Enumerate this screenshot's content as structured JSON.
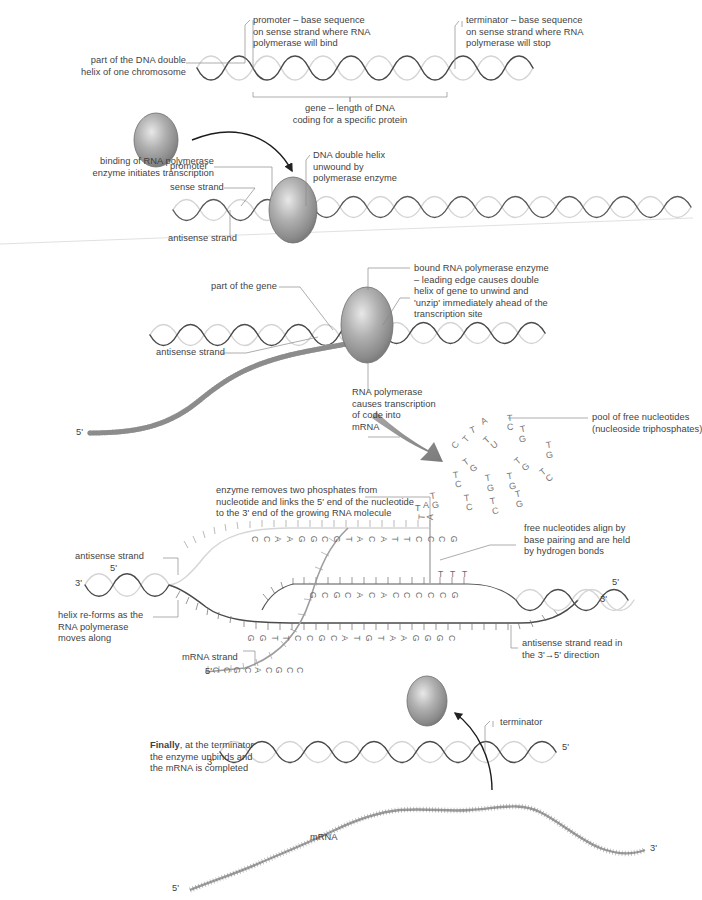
{
  "diagram": {
    "colors": {
      "sense_strand": "#555555",
      "antisense_strand": "#cccccc",
      "leader_line": "#8a8a8a",
      "text": "#3f3f3f",
      "enzyme_fill": "#8e8e8e",
      "enzyme_edge": "#5f5f5f",
      "mrna": "#9a9a9a",
      "separator": "#d8d8d8"
    }
  },
  "stage1": {
    "label_chromosome": "part of the DNA double\nhelix of one chromosome",
    "label_promoter": "promoter – base sequence\non sense strand where RNA\npolymerase will bind",
    "label_terminator": "terminator – base sequence\non sense strand where RNA\npolymerase will stop",
    "label_gene": "gene – length of DNA\ncoding for a specific protein"
  },
  "stage2": {
    "label_binding": "binding of RNA polymerase\nenzyme initiates transcription",
    "label_promoter": "promoter",
    "label_sense": "sense strand",
    "label_antisense": "antisense strand",
    "label_unwound": "DNA double helix\nunwound by\npolymerase enzyme"
  },
  "stage3": {
    "label_part_of_gene": "part of the gene",
    "label_antisense": "antisense strand",
    "label_bound_enzyme": "bound RNA polymerase enzyme\n– leading edge causes double\nhelix of gene to unwind and\n'unzip' immediately ahead of the\ntranscription site",
    "label_transcription": "RNA polymerase\ncauses transcription\nof code into\nmRNA",
    "label_pool": "pool of free nucleotides\n(nucleoside triphosphates)",
    "prime_5": "5'",
    "nucleotide_pool": [
      {
        "base": "T",
        "x": 470,
        "y": 425,
        "rot": -22
      },
      {
        "base": "A",
        "x": 481,
        "y": 416,
        "rot": -28
      },
      {
        "base": "C",
        "x": 452,
        "y": 440,
        "rot": -58
      },
      {
        "base": "T",
        "x": 463,
        "y": 434,
        "rot": -48
      },
      {
        "base": "U",
        "x": 491,
        "y": 440,
        "rot": -38
      },
      {
        "base": "T",
        "x": 484,
        "y": 435,
        "rot": -44
      },
      {
        "base": "C",
        "x": 507,
        "y": 422,
        "rot": -6
      },
      {
        "base": "T",
        "x": 507,
        "y": 413,
        "rot": -4
      },
      {
        "base": "G",
        "x": 519,
        "y": 434,
        "rot": -14
      },
      {
        "base": "T",
        "x": 520,
        "y": 424,
        "rot": -12
      },
      {
        "base": "G",
        "x": 546,
        "y": 450,
        "rot": -10
      },
      {
        "base": "T",
        "x": 546,
        "y": 440,
        "rot": -8
      },
      {
        "base": "G",
        "x": 470,
        "y": 463,
        "rot": -34
      },
      {
        "base": "T",
        "x": 463,
        "y": 457,
        "rot": -34
      },
      {
        "base": "G",
        "x": 522,
        "y": 462,
        "rot": -40
      },
      {
        "base": "T",
        "x": 515,
        "y": 456,
        "rot": -40
      },
      {
        "base": "C",
        "x": 455,
        "y": 479,
        "rot": -8
      },
      {
        "base": "T",
        "x": 453,
        "y": 470,
        "rot": -6
      },
      {
        "base": "G",
        "x": 487,
        "y": 483,
        "rot": -10
      },
      {
        "base": "T",
        "x": 485,
        "y": 473,
        "rot": -8
      },
      {
        "base": "G",
        "x": 509,
        "y": 481,
        "rot": -12
      },
      {
        "base": "T",
        "x": 507,
        "y": 471,
        "rot": -10
      },
      {
        "base": "C",
        "x": 546,
        "y": 473,
        "rot": -38
      },
      {
        "base": "T",
        "x": 540,
        "y": 467,
        "rot": -38
      },
      {
        "base": "G",
        "x": 432,
        "y": 500,
        "rot": -10
      },
      {
        "base": "T",
        "x": 430,
        "y": 491,
        "rot": -8
      },
      {
        "base": "C",
        "x": 466,
        "y": 502,
        "rot": -8
      },
      {
        "base": "T",
        "x": 464,
        "y": 493,
        "rot": -6
      },
      {
        "base": "C",
        "x": 492,
        "y": 506,
        "rot": -12
      },
      {
        "base": "T",
        "x": 490,
        "y": 496,
        "rot": -10
      },
      {
        "base": "G",
        "x": 516,
        "y": 499,
        "rot": -14
      },
      {
        "base": "T",
        "x": 515,
        "y": 489,
        "rot": -12
      },
      {
        "base": "A",
        "x": 427,
        "y": 512,
        "rot": -86
      },
      {
        "base": "T",
        "x": 419,
        "y": 512,
        "rot": -86
      }
    ]
  },
  "stage4": {
    "label_enzyme_removes": "enzyme removes two phosphates from\nnucleotide and links the 5' end of the nucleotide\nto the 3' end of the growing RNA molecule",
    "label_free_nucleotides": "free nucleotides align by\nbase pairing and are held\nby hydrogen bonds",
    "label_antisense": "antisense strand",
    "label_helix_reforms": "helix re-forms as the\nRNA polymerase\nmoves along",
    "label_mrna_strand": "mRNA strand",
    "label_read_direction": "antisense strand read in\nthe 3'→5' direction",
    "sense_top_bases": [
      "C",
      "C",
      "A",
      "A",
      "G",
      "G",
      "C",
      "G",
      "T",
      "A",
      "C",
      "A",
      "T",
      "T",
      "C",
      "C",
      "C",
      "G"
    ],
    "antisense_bases": [
      "G",
      "C",
      "G",
      "C",
      "A",
      "C",
      "A",
      "C",
      "C",
      "C",
      "C",
      "C",
      "G"
    ],
    "template_bases": [
      "G",
      "G",
      "T",
      "T",
      "C",
      "C",
      "G",
      "C",
      "A",
      "T",
      "G",
      "T",
      "A",
      "A",
      "G",
      "G",
      "G",
      "C"
    ],
    "mrna_bases": [
      "C",
      "C",
      "G",
      "C",
      "A",
      "C",
      "G",
      "C",
      "C"
    ],
    "primes": {
      "left_5": "5'",
      "left_3": "3'",
      "right_5": "5'",
      "right_3": "3'",
      "mrna_5": "5'"
    },
    "loose_bases": [
      {
        "base": "A",
        "x": 423,
        "y": 500
      },
      {
        "base": "T",
        "x": 415,
        "y": 503
      }
    ],
    "free_T": [
      "T",
      "T",
      "T"
    ]
  },
  "stage5": {
    "label_finally_bold": "Finally",
    "label_finally_rest": ", at the terminator\nthe enzyme unbinds and\nthe mRNA is completed",
    "label_terminator": "terminator",
    "label_mrna": "mRNA",
    "primes": {
      "dna_3": "3'",
      "dna_5": "5'",
      "mrna_5": "5'",
      "mrna_3": "3'"
    }
  }
}
